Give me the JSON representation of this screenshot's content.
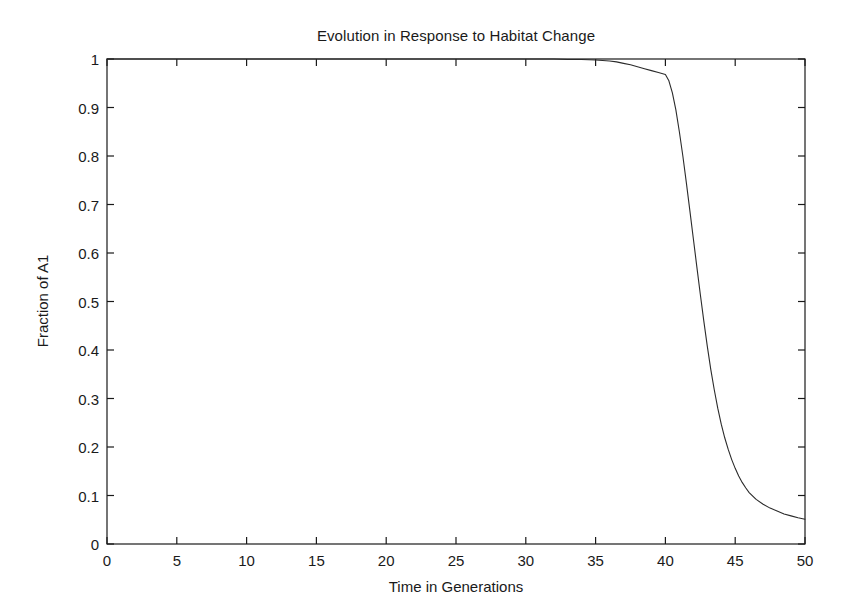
{
  "figure": {
    "background_color": "#ffffff",
    "axes_color": "#1a1a1a",
    "line_color": "#2b2b2b"
  },
  "chart_data": {
    "type": "line",
    "title": "Evolution in Response to Habitat Change",
    "xlabel": "Time in Generations",
    "ylabel": "Fraction of A1",
    "xlim": [
      0,
      50
    ],
    "ylim": [
      0,
      1
    ],
    "grid": false,
    "legend": null,
    "xticks": [
      0,
      5,
      10,
      15,
      20,
      25,
      30,
      35,
      40,
      45,
      50
    ],
    "xtick_labels": [
      "0",
      "5",
      "10",
      "15",
      "20",
      "25",
      "30",
      "35",
      "40",
      "45",
      "50"
    ],
    "yticks": [
      0,
      0.1,
      0.2,
      0.3,
      0.4,
      0.5,
      0.6,
      0.7,
      0.8,
      0.9,
      1
    ],
    "ytick_labels": [
      "0",
      "0.1",
      "0.2",
      "0.3",
      "0.4",
      "0.5",
      "0.6",
      "0.7",
      "0.8",
      "0.9",
      "1"
    ],
    "series": [
      {
        "name": "Fraction of A1",
        "color": "#2b2b2b",
        "linewidth": 1.1,
        "x": [
          0,
          1,
          2,
          3,
          4,
          5,
          6,
          7,
          8,
          9,
          10,
          11,
          12,
          13,
          14,
          15,
          16,
          17,
          18,
          19,
          20,
          21,
          22,
          23,
          24,
          25,
          26,
          27,
          28,
          29,
          30,
          31,
          32,
          33,
          34,
          35,
          35.5,
          36,
          36.5,
          37,
          37.5,
          38,
          38.5,
          39,
          39.5,
          40,
          40.25,
          40.5,
          40.75,
          41,
          41.25,
          41.5,
          41.75,
          42,
          42.25,
          42.5,
          42.75,
          43,
          43.25,
          43.5,
          43.75,
          44,
          44.25,
          44.5,
          44.75,
          45,
          45.25,
          45.5,
          45.75,
          46,
          46.5,
          47,
          47.5,
          48,
          48.5,
          49,
          49.5,
          50
        ],
        "y": [
          1,
          1,
          1,
          1,
          1,
          1,
          1,
          1,
          1,
          1,
          1,
          1,
          1,
          1,
          1,
          1,
          1,
          1,
          1,
          1,
          1,
          1,
          1,
          1,
          1,
          1,
          1,
          1,
          1,
          1,
          1,
          1,
          1,
          0.999,
          0.999,
          0.998,
          0.997,
          0.996,
          0.994,
          0.991,
          0.988,
          0.984,
          0.98,
          0.976,
          0.972,
          0.968,
          0.955,
          0.93,
          0.895,
          0.85,
          0.8,
          0.745,
          0.688,
          0.63,
          0.572,
          0.515,
          0.46,
          0.408,
          0.36,
          0.318,
          0.28,
          0.247,
          0.219,
          0.195,
          0.174,
          0.156,
          0.14,
          0.127,
          0.116,
          0.106,
          0.092,
          0.082,
          0.074,
          0.068,
          0.062,
          0.058,
          0.054,
          0.051
        ]
      }
    ]
  }
}
